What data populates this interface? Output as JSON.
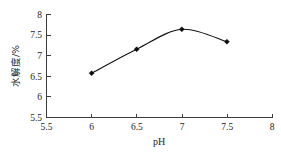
{
  "chart_data": {
    "type": "line",
    "title": "",
    "xlabel": "pH",
    "ylabel": "水解度/%",
    "x": [
      6,
      6.5,
      7,
      7.5
    ],
    "values": [
      6.57,
      7.15,
      7.63,
      7.33
    ],
    "series": [
      {
        "name": "水解度",
        "x": [
          6,
          6.5,
          7,
          7.5
        ],
        "values": [
          6.57,
          7.15,
          7.63,
          7.33
        ]
      }
    ],
    "xlim": [
      5.5,
      8
    ],
    "ylim": [
      5.5,
      8
    ],
    "xticks": [
      5.5,
      6,
      6.5,
      7,
      7.5,
      8
    ],
    "yticks": [
      5.5,
      6,
      6.5,
      7,
      7.5,
      8
    ],
    "xtick_labels": [
      "5.5",
      "6",
      "6.5",
      "7",
      "7.5",
      "8"
    ],
    "ytick_labels": [
      "5.5",
      "6",
      "6.5",
      "7",
      "7.5",
      "8"
    ],
    "grid": false,
    "legend": null,
    "marker": "diamond",
    "line_color": "#111111",
    "marker_color": "#0d0d0d",
    "background_color": "#ffffff"
  },
  "axes": {
    "x_axis_label": "pH",
    "y_axis_label": "水解度/%",
    "x_ticks": [
      {
        "label": "5.5",
        "value": 5.5
      },
      {
        "label": "6",
        "value": 6
      },
      {
        "label": "6.5",
        "value": 6.5
      },
      {
        "label": "7",
        "value": 7
      },
      {
        "label": "7.5",
        "value": 7.5
      },
      {
        "label": "8",
        "value": 8
      }
    ],
    "y_ticks": [
      {
        "label": "8",
        "value": 8
      },
      {
        "label": "7.5",
        "value": 7.5
      },
      {
        "label": "7",
        "value": 7
      },
      {
        "label": "6.5",
        "value": 6.5
      },
      {
        "label": "6",
        "value": 6
      },
      {
        "label": "5.5",
        "value": 5.5
      }
    ]
  },
  "points": [
    {
      "x": 6,
      "y": 6.57
    },
    {
      "x": 6.5,
      "y": 7.15
    },
    {
      "x": 7,
      "y": 7.63
    },
    {
      "x": 7.5,
      "y": 7.33
    }
  ]
}
